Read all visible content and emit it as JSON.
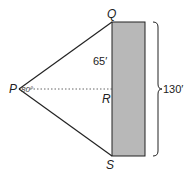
{
  "diagram": {
    "points": {
      "P": "P",
      "Q": "Q",
      "R": "R",
      "S": "S"
    },
    "angle_label": "80°",
    "segment_label_QR": "65′",
    "total_height_label": "130′",
    "colors": {
      "building_fill": "#b8b8b8",
      "stroke": "#222222",
      "dotted": "#555555"
    }
  }
}
